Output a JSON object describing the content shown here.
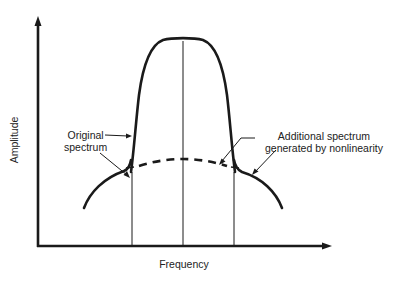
{
  "diagram": {
    "type": "spectrum-diagram",
    "axes": {
      "x_label": "Frequency",
      "y_label": "Amplitude"
    },
    "annotations": {
      "original": {
        "line1": "Original",
        "line2": "spectrum"
      },
      "additional": {
        "line1": "Additional spectrum",
        "line2": "generated by nonlinearity"
      }
    },
    "curves": [
      {
        "name": "original-spectrum",
        "style": "solid",
        "description": "Bandpass-shaped main spectrum with flat top"
      },
      {
        "name": "spectral-regrowth",
        "style": "solid skirts + dashed in-band",
        "description": "Additional spectrum generated by nonlinearity"
      }
    ],
    "vertical_markers": 3,
    "colors": {
      "line": "#1a1a1a",
      "text": "#222222",
      "background": "#ffffff"
    }
  }
}
